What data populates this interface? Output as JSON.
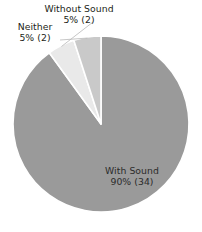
{
  "chart_data": {
    "type": "pie",
    "title": "",
    "subtitle": "",
    "xlabel": "",
    "ylabel": "",
    "legend_position": "none",
    "grid": false,
    "labels_inside": [
      "With Sound"
    ],
    "labels_outside": [
      "Without Sound",
      "Neither"
    ],
    "start_angle_deg": 0,
    "direction": "clockwise",
    "total_count": 38,
    "categories": [
      "With Sound",
      "Without Sound",
      "Neither"
    ],
    "values": [
      90,
      5,
      5
    ],
    "counts": [
      34,
      2,
      2
    ],
    "colors": [
      "#9a9a9a",
      "#e9e9e9",
      "#c9c9c9"
    ],
    "separator_color": "#ffffff",
    "slices": [
      {
        "name": "With Sound",
        "percent": 90,
        "count": 34,
        "value_text": "90% (34)",
        "color": "#9a9a9a",
        "start_angle_deg": 0,
        "end_angle_deg": 324
      },
      {
        "name": "Without Sound",
        "percent": 5,
        "count": 2,
        "value_text": "5% (2)",
        "color": "#e9e9e9",
        "start_angle_deg": 324,
        "end_angle_deg": 342
      },
      {
        "name": "Neither",
        "percent": 5,
        "count": 2,
        "value_text": "5% (2)",
        "color": "#c9c9c9",
        "start_angle_deg": 342,
        "end_angle_deg": 360
      }
    ]
  },
  "labels": {
    "without_sound": {
      "name": "Without Sound",
      "value": "5% (2)"
    },
    "neither": {
      "name": "Neither",
      "value": "5% (2)"
    },
    "with_sound": {
      "name": "With Sound",
      "value": "90% (34)"
    }
  },
  "geometry": {
    "center_x": 101,
    "center_y": 124,
    "radius": 88
  }
}
